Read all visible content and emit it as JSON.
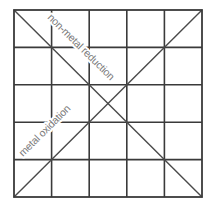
{
  "diagram": {
    "type": "5x5 grid with crossing diagonals",
    "grid": {
      "rows": 5,
      "cols": 5
    },
    "colors": {
      "lines": "#3a3a3a",
      "labels": "#7a7a7a",
      "background": "#ffffff"
    },
    "labels": {
      "descending_diagonal": "non-metal reduction",
      "ascending_diagonal": "metal oxidation"
    },
    "footer_caption": ""
  }
}
